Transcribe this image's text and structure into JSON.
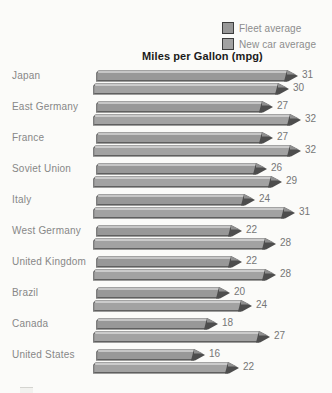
{
  "chart_data": {
    "type": "bar",
    "orientation": "horizontal",
    "title": "Miles per Gallon (mpg)",
    "legend_position": "top-right",
    "grid": false,
    "xlim": [
      0,
      34
    ],
    "categories": [
      "Japan",
      "East Germany",
      "France",
      "Soviet Union",
      "Italy",
      "West Germany",
      "United Kingdom",
      "Brazil",
      "Canada",
      "United States"
    ],
    "series": [
      {
        "name": "Fleet average",
        "values": [
          31,
          27,
          27,
          26,
          24,
          22,
          22,
          20,
          18,
          16
        ],
        "face_color": "#989898",
        "bevel_color": "#c6c6c6",
        "tip_color": "#4d4d4d",
        "shadow_color": "#5f5f5f"
      },
      {
        "name": "New car average",
        "values": [
          30,
          32,
          32,
          29,
          31,
          28,
          28,
          24,
          27,
          22
        ],
        "face_color": "#a2a2a2",
        "bevel_color": "#cbcbcb",
        "tip_color": "#4d4d4d",
        "shadow_color": "#5f5f5f"
      }
    ]
  },
  "colors": {
    "background": "#fbfbf9",
    "title_text": "#1b1b1b",
    "label_text": "#878787",
    "value_text": "#767676",
    "legend_border": "#3d3d3d"
  }
}
